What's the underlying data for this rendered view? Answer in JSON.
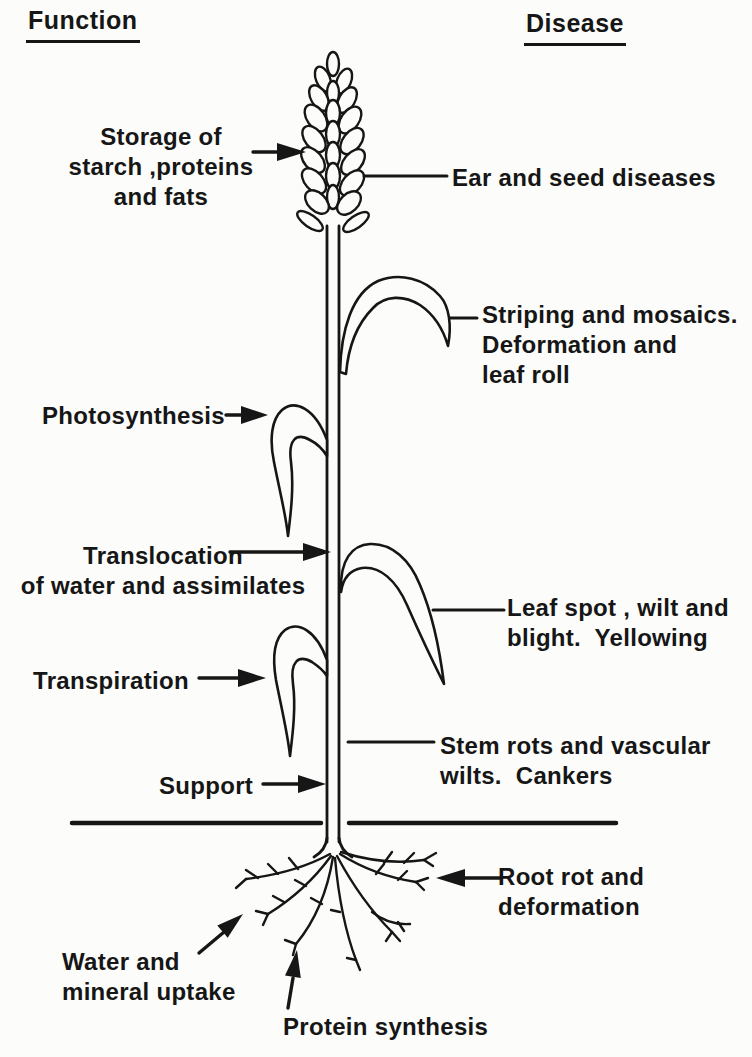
{
  "page": {
    "background_color": "#fcfcfa",
    "ink_color": "#161616"
  },
  "headers": {
    "function": "Function",
    "disease": "Disease"
  },
  "functions": {
    "storage": "Storage of\nstarch ,proteins\nand fats",
    "photosynthesis": "Photosynthesis",
    "translocation": "Translocation\nof water and assimilates",
    "transpiration": "Transpiration",
    "support": "Support",
    "water_uptake": "Water and\nmineral uptake",
    "protein_synthesis": "Protein synthesis"
  },
  "diseases": {
    "ear_seed": "Ear and seed diseases",
    "striping": "Striping and mosaics.\nDeformation and\nleaf roll",
    "leaf_spot": "Leaf spot , wilt and\nblight.  Yellowing",
    "stem_rots": "Stem rots and vascular\nwilts.  Cankers",
    "root_rot": "Root rot and\ndeformation"
  }
}
